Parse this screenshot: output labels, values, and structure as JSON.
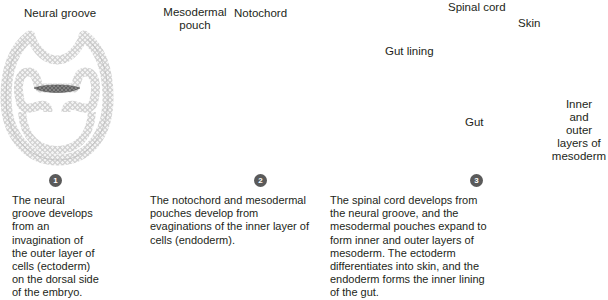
{
  "diagram": {
    "colors": {
      "cell_fill": "#f1f1f1",
      "cell_stroke": "#a9a9a9",
      "notochord_fill": "#7d7d7d",
      "notochord_stroke": "#555555",
      "arrow_fill": "#e6e6e6",
      "arrow_stroke": "#8a8a8a",
      "leader_line": "#333333",
      "badge": "#5a5a5a"
    },
    "stages": [
      {
        "number": "1",
        "labels": [
          "Neural groove"
        ],
        "caption": "The neural groove develops from an invagination of the outer layer of cells (ectoderm) on the dorsal side of the embryo."
      },
      {
        "number": "2",
        "labels": [
          "Mesodermal pouch",
          "Notochord"
        ],
        "caption": "The notochord and mesodermal pouches develop from evaginations of the inner layer of cells (endoderm)."
      },
      {
        "number": "3",
        "labels": [
          "Spinal cord",
          "Skin",
          "Gut lining",
          "Gut",
          "Inner and outer layers of mesoderm"
        ],
        "caption": "The spinal cord develops from the neural groove, and the mesodermal pouches expand to form inner and outer layers of mesoderm. The ectoderm differentiates into skin, and the endoderm forms the inner lining of the gut."
      }
    ],
    "label_lines": {
      "mesodermal_pouch": [
        "Mesodermal",
        "pouch"
      ],
      "inner_outer": [
        "Inner",
        "and",
        "outer",
        "layers of",
        "mesoderm"
      ]
    }
  }
}
